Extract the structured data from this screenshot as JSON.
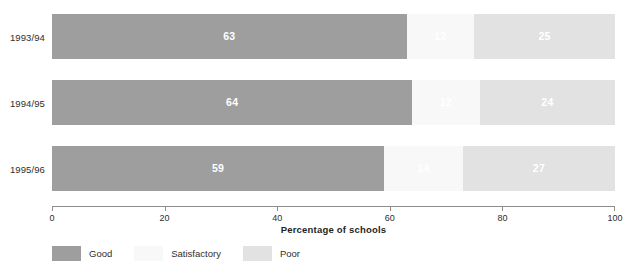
{
  "chart_data": {
    "type": "bar",
    "orientation": "horizontal",
    "stacked": true,
    "title": "",
    "subtitle": "",
    "xlabel": "Percentage of schools",
    "ylabel": "",
    "xlim": [
      0,
      100
    ],
    "xticks": [
      0,
      20,
      40,
      60,
      80,
      100
    ],
    "xticklabels": [
      "0",
      "20",
      "40",
      "60",
      "80",
      "100"
    ],
    "grid": false,
    "legend_position": "bottom-left",
    "categories": [
      "1993/94",
      "1994/95",
      "1995/96"
    ],
    "series": [
      {
        "name": "Good",
        "color": "#9e9e9e",
        "values": [
          63,
          64,
          59
        ]
      },
      {
        "name": "Satisfactory",
        "color": "#f8f8f8",
        "values": [
          12,
          12,
          14
        ]
      },
      {
        "name": "Poor",
        "color": "#e2e2e2",
        "values": [
          25,
          24,
          27
        ]
      }
    ],
    "bars": [
      {
        "category": "1993/94",
        "segments": [
          {
            "name": "Good",
            "value": 63,
            "label": "63",
            "color": "#9e9e9e"
          },
          {
            "name": "Satisfactory",
            "value": 12,
            "label": "12",
            "color": "#f8f8f8"
          },
          {
            "name": "Poor",
            "value": 25,
            "label": "25",
            "color": "#e2e2e2"
          }
        ]
      },
      {
        "category": "1994/95",
        "segments": [
          {
            "name": "Good",
            "value": 64,
            "label": "64",
            "color": "#9e9e9e"
          },
          {
            "name": "Satisfactory",
            "value": 12,
            "label": "12",
            "color": "#f8f8f8"
          },
          {
            "name": "Poor",
            "value": 24,
            "label": "24",
            "color": "#e2e2e2"
          }
        ]
      },
      {
        "category": "1995/96",
        "segments": [
          {
            "name": "Good",
            "value": 59,
            "label": "59",
            "color": "#9e9e9e"
          },
          {
            "name": "Satisfactory",
            "value": 14,
            "label": "14",
            "color": "#f8f8f8"
          },
          {
            "name": "Poor",
            "value": 27,
            "label": "27",
            "color": "#e2e2e2"
          }
        ]
      }
    ],
    "legend": [
      {
        "label": "Good",
        "color": "#9e9e9e"
      },
      {
        "label": "Satisfactory",
        "color": "#f8f8f8"
      },
      {
        "label": "Poor",
        "color": "#e2e2e2"
      }
    ]
  },
  "axis": {
    "title": "Percentage of schools"
  }
}
